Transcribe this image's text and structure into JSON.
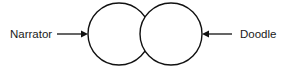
{
  "diagram": {
    "type": "venn",
    "background_color": "#ffffff",
    "stroke_color": "#111111",
    "text_color": "#1a1a1a",
    "sets": [
      {
        "id": "narrator",
        "label": "Narrator",
        "side": "left",
        "center_x": 119,
        "center_y": 34,
        "radius": 31
      },
      {
        "id": "doodle",
        "label": "Doodle",
        "side": "right",
        "center_x": 171,
        "center_y": 34,
        "radius": 31
      }
    ],
    "callouts": [
      {
        "id": "narrator-callout",
        "label": "Narrator",
        "label_anchor_x": 10,
        "label_anchor_y": 35,
        "line_start_x": 57,
        "line_end_x": 87,
        "line_y": 34,
        "arrow_direction": "right"
      },
      {
        "id": "doodle-callout",
        "label": "Doodle",
        "label_anchor_x": 240,
        "label_anchor_y": 35,
        "line_start_x": 232,
        "line_end_x": 203,
        "line_y": 34,
        "arrow_direction": "left"
      }
    ]
  }
}
